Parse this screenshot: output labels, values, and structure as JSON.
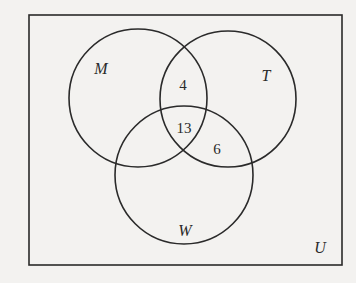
{
  "diagram": {
    "type": "venn-3",
    "colors": {
      "background": "#f3f2f0",
      "stroke": "#2a2a2a"
    },
    "universe": {
      "label": "U",
      "x": 29,
      "y": 15,
      "width": 313,
      "height": 250
    },
    "sets": [
      {
        "id": "M",
        "label": "M",
        "cx": 138,
        "cy": 98,
        "r": 69,
        "label_x": 101,
        "label_y": 74
      },
      {
        "id": "T",
        "label": "T",
        "cx": 228,
        "cy": 99,
        "r": 68,
        "label_x": 266,
        "label_y": 81
      },
      {
        "id": "W",
        "label": "W",
        "cx": 184,
        "cy": 175,
        "r": 69,
        "label_x": 185,
        "label_y": 236
      }
    ],
    "regions": [
      {
        "name": "M∩T only",
        "value": "4",
        "x": 183,
        "y": 90
      },
      {
        "name": "M∩T∩W",
        "value": "13",
        "x": 184,
        "y": 133
      },
      {
        "name": "T∩W only",
        "value": "6",
        "x": 217,
        "y": 154
      }
    ],
    "universe_label_pos": {
      "x": 320,
      "y": 253
    }
  }
}
